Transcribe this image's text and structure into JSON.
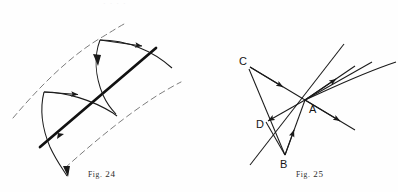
{
  "page": {
    "width": 398,
    "height": 192,
    "background_color": "#fefefe",
    "ink_color": "#1a1a1a",
    "caption_color": "#2b2b2b",
    "bleed_artifact_text": "·  ·   ·  ·"
  },
  "figures": [
    {
      "id": "fig24",
      "caption_prefix": "Fig.",
      "caption_number": "24",
      "caption_full": "Fig. 24",
      "description": "Two dashed parallel guide curves bounding a band; a heavy solid straight line crosses the band diagonally; two thin arrowed arcs (wave fronts) cross the band with arrowheads indicating direction of travel.",
      "elements": {
        "dashed_guides": 2,
        "heavy_line": 1,
        "arrowed_arcs": 2,
        "arrowheads": 6
      }
    },
    {
      "id": "fig25",
      "caption_prefix": "Fig.",
      "caption_number": "25",
      "caption_full": "Fig. 25",
      "description": "Point A is a convergence node on the right; rays arrive from labelled points C, D and B on the left, and refracted/continuing rays with arrowheads fan out to the upper right and lower right.",
      "labels": [
        {
          "id": "label-a",
          "text": "A",
          "x": 310,
          "y": 109
        },
        {
          "id": "label-b",
          "text": "B",
          "x": 281,
          "y": 161
        },
        {
          "id": "label-c",
          "text": "C",
          "x": 241,
          "y": 62
        },
        {
          "id": "label-d",
          "text": "D",
          "x": 259,
          "y": 124
        }
      ],
      "elements": {
        "rays_out": 4,
        "rays_in": 3,
        "arrowheads": 5
      }
    }
  ]
}
